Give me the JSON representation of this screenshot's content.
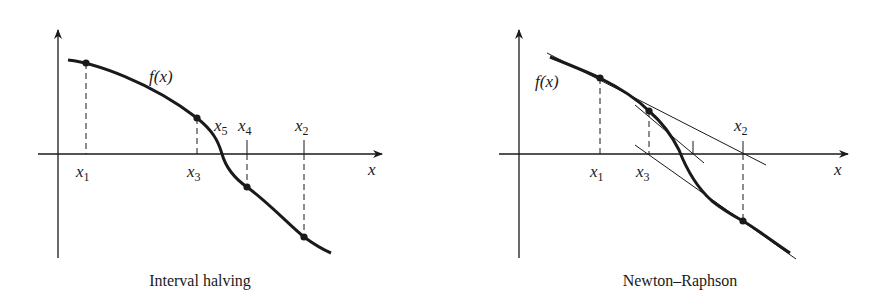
{
  "figure": {
    "panels": [
      {
        "id": "interval-halving",
        "caption": "Interval halving",
        "function_label": "f(x)",
        "axis_label": "x",
        "points": [
          {
            "name": "x",
            "sub": "1",
            "label_position": "below"
          },
          {
            "name": "x",
            "sub": "3",
            "label_position": "below"
          },
          {
            "name": "x",
            "sub": "5",
            "label_position": "above"
          },
          {
            "name": "x",
            "sub": "4",
            "label_position": "above"
          },
          {
            "name": "x",
            "sub": "2",
            "label_position": "above"
          }
        ]
      },
      {
        "id": "newton-raphson",
        "caption": "Newton–Raphson",
        "function_label": "f(x)",
        "axis_label": "x",
        "points": [
          {
            "name": "x",
            "sub": "1",
            "label_position": "below"
          },
          {
            "name": "x",
            "sub": "3",
            "label_position": "below"
          },
          {
            "name": "x",
            "sub": "2",
            "label_position": "above"
          }
        ]
      }
    ],
    "colors": {
      "ink": "#1a1a1a",
      "background": "#ffffff"
    }
  }
}
